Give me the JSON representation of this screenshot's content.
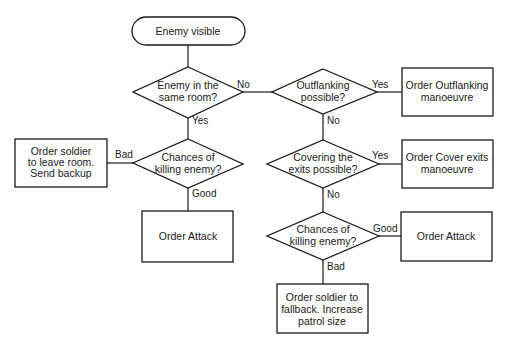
{
  "diagram": {
    "type": "flowchart",
    "nodes": {
      "start": {
        "shape": "terminator",
        "lines": [
          "Enemy visible"
        ]
      },
      "same_room": {
        "shape": "decision",
        "lines": [
          "Enemy in the",
          "same room?"
        ]
      },
      "outflanking": {
        "shape": "decision",
        "lines": [
          "Outflanking",
          "possible?"
        ]
      },
      "order_outflanking": {
        "shape": "process",
        "lines": [
          "Order Outflanking",
          "manoeuvre"
        ]
      },
      "covering": {
        "shape": "decision",
        "lines": [
          "Covering the",
          "exits possible?"
        ]
      },
      "order_cover": {
        "shape": "process",
        "lines": [
          "Order Cover exits",
          "manoeuvre"
        ]
      },
      "chances_left": {
        "shape": "decision",
        "lines": [
          "Chances of",
          "killing enemy?"
        ]
      },
      "leave_room": {
        "shape": "process",
        "lines": [
          "Order soldier",
          "to leave room.",
          "Send backup"
        ]
      },
      "attack_left": {
        "shape": "process",
        "lines": [
          "Order Attack"
        ]
      },
      "chances_right": {
        "shape": "decision",
        "lines": [
          "Chances of",
          "killing enemy?"
        ]
      },
      "attack_right": {
        "shape": "process",
        "lines": [
          "Order Attack"
        ]
      },
      "fallback": {
        "shape": "process",
        "lines": [
          "Order soldier to",
          "fallback.  Increase",
          "patrol size"
        ]
      }
    },
    "edges": [
      {
        "from": "start",
        "to": "same_room",
        "label": ""
      },
      {
        "from": "same_room",
        "to": "outflanking",
        "label": "No"
      },
      {
        "from": "same_room",
        "to": "chances_left",
        "label": "Yes"
      },
      {
        "from": "outflanking",
        "to": "order_outflanking",
        "label": "Yes"
      },
      {
        "from": "outflanking",
        "to": "covering",
        "label": "No"
      },
      {
        "from": "covering",
        "to": "order_cover",
        "label": "Yes"
      },
      {
        "from": "covering",
        "to": "chances_right",
        "label": "No"
      },
      {
        "from": "chances_left",
        "to": "leave_room",
        "label": "Bad"
      },
      {
        "from": "chances_left",
        "to": "attack_left",
        "label": "Good"
      },
      {
        "from": "chances_right",
        "to": "attack_right",
        "label": "Good"
      },
      {
        "from": "chances_right",
        "to": "fallback",
        "label": "Bad"
      }
    ],
    "edge_labels": {
      "no1": "No",
      "yes1": "Yes",
      "yes2": "Yes",
      "no2": "No",
      "yes3": "Yes",
      "no3": "No",
      "bad1": "Bad",
      "good1": "Good",
      "good2": "Good",
      "bad2": "Bad"
    }
  }
}
